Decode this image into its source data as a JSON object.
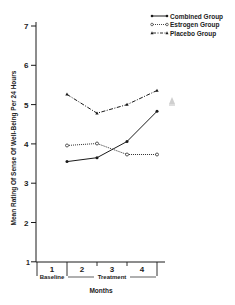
{
  "chart_data": {
    "type": "line",
    "title": "",
    "xlabel": "Months",
    "ylabel": "Mean Rating Of Sense Of Well-Being Per 24 Hours",
    "categories": [
      "1",
      "2",
      "3",
      "4"
    ],
    "x_period_labels": [
      {
        "label": "Baseline",
        "months": [
          "1"
        ]
      },
      {
        "label": "Treatment",
        "months": [
          "2",
          "3",
          "4"
        ]
      }
    ],
    "yticks": [
      1,
      2,
      3,
      4,
      5,
      6,
      7
    ],
    "ylim": [
      1,
      7
    ],
    "grid": false,
    "legend_position": "top-right",
    "series": [
      {
        "name": "Combined Group",
        "marker": "filled-circle",
        "line": "solid",
        "values": [
          3.55,
          3.65,
          4.06,
          4.83
        ]
      },
      {
        "name": "Estrogen Group",
        "marker": "open-circle",
        "line": "dotted",
        "values": [
          3.96,
          4.01,
          3.73,
          3.73
        ]
      },
      {
        "name": "Placebo Group",
        "marker": "filled-triangle",
        "line": "dash-dot",
        "values": [
          5.26,
          4.78,
          5.0,
          5.36
        ]
      }
    ]
  },
  "legend": {
    "items": [
      "Combined Group",
      "Estrogen Group",
      "Placebo Group"
    ]
  },
  "axes": {
    "ylabel": "Mean Rating Of Sense Of Well-Being Per 24 Hours",
    "xlabel": "Months",
    "baseline": "Baseline",
    "treatment": "Treatment",
    "yticks": [
      "1",
      "2",
      "3",
      "4",
      "5",
      "6",
      "7"
    ],
    "xticks": [
      "1",
      "2",
      "3",
      "4"
    ]
  },
  "colors": {
    "ink": "#1a1a1a",
    "artifact": "#c8c8c8"
  }
}
